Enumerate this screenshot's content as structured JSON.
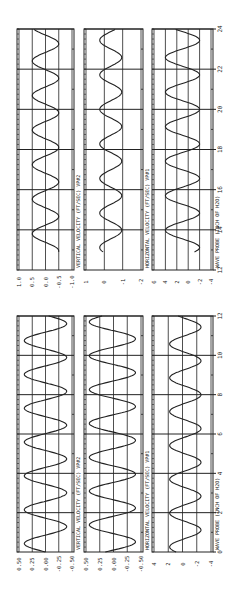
{
  "figure": {
    "orientation": "rotated-90-ccw",
    "ink_color": "#222222",
    "background": "#ffffff"
  },
  "chart_data": [
    {
      "type": "line",
      "group": "t 12-24",
      "title": "",
      "xlabel": "WAVE PROBE (INCH OF H2O)",
      "x_ticks": [
        "12",
        "14",
        "16",
        "18",
        "20",
        "22",
        "24"
      ],
      "xlim": [
        12,
        24
      ],
      "panels": [
        {
          "label": "VERTICAL VELOCITY (FT/SEC) VP#2",
          "y_ticks": [
            "1.0",
            "0.5",
            "0.0",
            "-0.5",
            "-1.0"
          ],
          "ylim": [
            -1.0,
            1.0
          ],
          "series": {
            "name": "vertical velocity",
            "amplitude": 0.5,
            "offset": 0.0,
            "period": 1.72,
            "phase": 0.2,
            "start": 12.9
          }
        },
        {
          "label": "HORIZONTAL VELOCITY (FT/SEC) VP#1",
          "y_ticks": [
            "1",
            "0",
            "-1",
            "-2"
          ],
          "ylim": [
            -2,
            1
          ],
          "series": {
            "name": "horizontal velocity",
            "amplitude": 0.6,
            "offset": -0.35,
            "period": 1.72,
            "phase": 0.6,
            "start": 12.9
          }
        },
        {
          "label": "WAVE PROBE (INCH OF H2O)",
          "y_ticks": [
            "6",
            "4",
            "2",
            "0",
            "-2",
            "-4"
          ],
          "ylim": [
            -4,
            6
          ],
          "series": {
            "name": "wave probe",
            "amplitude": 3.0,
            "offset": 1.0,
            "period": 1.72,
            "phase": 0.1,
            "start": 12.9
          }
        }
      ]
    },
    {
      "type": "line",
      "group": "t 0-12",
      "title": "",
      "xlabel": "WAVE PROBE (INCH OF H2O)",
      "x_ticks": [
        "0",
        "2",
        "4",
        "6",
        "8",
        "10",
        "12"
      ],
      "xlim": [
        0,
        12
      ],
      "panels": [
        {
          "label": "VERTICAL VELOCITY (FT/SEC) VP#2",
          "y_ticks": [
            "0.50",
            "0.25",
            "0.00",
            "-0.25",
            "-0.50"
          ],
          "ylim": [
            -0.5,
            0.5
          ],
          "series": {
            "name": "vertical velocity",
            "amplitude": 0.4,
            "offset": 0.0,
            "period": 1.72,
            "phase": 0.0,
            "start": 0.0
          }
        },
        {
          "label": "HORIZONTAL VELOCITY (FT/SEC) VP#1",
          "y_ticks": [
            "0.50",
            "0.25",
            "0.00",
            "-0.25",
            "-0.50"
          ],
          "ylim": [
            -0.5,
            0.5
          ],
          "series": {
            "name": "horizontal velocity",
            "amplitude": 0.42,
            "offset": 0.02,
            "period": 1.72,
            "phase": 0.45,
            "start": 0.0
          }
        },
        {
          "label": "WAVE PROBE (INCH OF H2O)",
          "y_ticks": [
            "4",
            "2",
            "0",
            "-2",
            "-4"
          ],
          "ylim": [
            -4,
            4
          ],
          "series": {
            "name": "wave probe",
            "amplitude": 2.2,
            "offset": -0.4,
            "period": 1.72,
            "phase": 0.1,
            "start": 0.0
          }
        }
      ]
    }
  ]
}
